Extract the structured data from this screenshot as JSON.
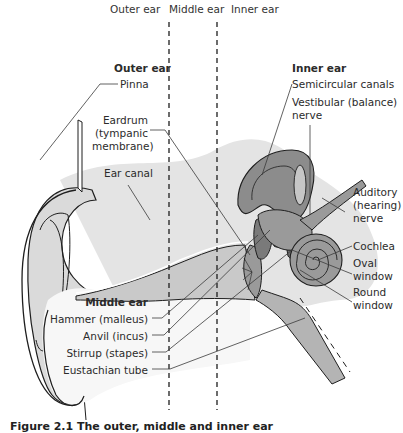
{
  "section_headers": {
    "outer": "Outer ear",
    "middle": "Middle ear",
    "inner": "Inner ear"
  },
  "groups": {
    "outer_ear": {
      "title": "Outer ear",
      "labels": [
        "Pinna",
        "Eardrum (tympanic membrane)",
        "Ear canal"
      ]
    },
    "middle_ear": {
      "title": "Middle ear",
      "labels": [
        "Hammer (malleus)",
        "Anvil (incus)",
        "Stirrup (stapes)",
        "Eustachian tube"
      ]
    },
    "inner_ear": {
      "title": "Inner ear",
      "labels": [
        "Semicircular canals",
        "Vestibular (balance) nerve",
        "Auditory (hearing) nerve",
        "Cochlea",
        "Oval window",
        "Round window"
      ]
    }
  },
  "label_text": {
    "outer_title": "Outer ear",
    "pinna": "Pinna",
    "eardrum_1": "Eardrum",
    "eardrum_2": "(tympanic",
    "eardrum_3": "membrane)",
    "ear_canal": "Ear canal",
    "middle_title": "Middle ear",
    "hammer": "Hammer (malleus)",
    "anvil": "Anvil (incus)",
    "stirrup": "Stirrup (stapes)",
    "eustachian": "Eustachian tube",
    "inner_title": "Inner ear",
    "semicircular": "Semicircular canals",
    "vestibular_1": "Vestibular (balance)",
    "vestibular_2": "nerve",
    "auditory_1": "Auditory",
    "auditory_2": "(hearing)",
    "auditory_3": "nerve",
    "cochlea": "Cochlea",
    "oval_1": "Oval",
    "oval_2": "window",
    "round_1": "Round",
    "round_2": "window"
  },
  "caption": "Figure 2.1   The outer, middle and inner ear",
  "colors": {
    "background": "#ffffff",
    "skin_light": "#e6e6e6",
    "skin_mid": "#d0d0d0",
    "tissue_gray": "#b8b8b8",
    "bone_dark": "#8a8a8a",
    "bone_darker": "#6e6e6e",
    "outline": "#1e1e1e",
    "leader": "#3a3a3a"
  }
}
